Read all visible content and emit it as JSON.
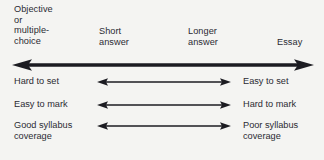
{
  "diagram": {
    "colors": {
      "background": "#f4f4f2",
      "text": "#2b2b33",
      "arrow": "#1c1c22"
    },
    "scale_labels": [
      {
        "name": "objective",
        "text": "Objective\nor\nmultiple-\nchoice"
      },
      {
        "name": "short-answer",
        "text": "Short\nanswer"
      },
      {
        "name": "longer-answer",
        "text": "Longer\nanswer"
      },
      {
        "name": "essay",
        "text": "Essay"
      }
    ],
    "main_axis": {
      "name": "continuum-axis",
      "left_arrowhead": true,
      "right_arrowhead": true
    },
    "rows": [
      {
        "name": "set",
        "left": "Hard to set",
        "right": "Easy to set"
      },
      {
        "name": "mark",
        "left": "Easy to mark",
        "right": "Hard to mark"
      },
      {
        "name": "syllabus",
        "left": "Good syllabus\ncoverage",
        "right": "Poor syllabus\ncoverage"
      }
    ]
  }
}
